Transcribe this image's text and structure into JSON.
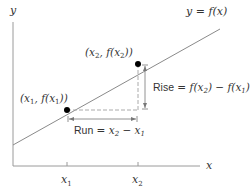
{
  "diagram": {
    "axes": {
      "x_label": "x",
      "y_label": "y",
      "x_ticks": [
        "x1",
        "x2"
      ]
    },
    "line": {
      "label": "y = f(x)"
    },
    "points": [
      {
        "label": "(x1, f(x1))"
      },
      {
        "label": "(x2, f(x2))"
      }
    ],
    "annotations": {
      "rise_prefix": "Rise",
      "rise_formula": "= f(x2) − f(x1)",
      "run_prefix": "Run",
      "run_formula": "= x2 − x1"
    },
    "colors": {
      "line": "#8a8a8a",
      "axis": "#9a9a9a",
      "dashed": "#aaaaaa",
      "point": "#000000",
      "text": "#333333"
    }
  }
}
